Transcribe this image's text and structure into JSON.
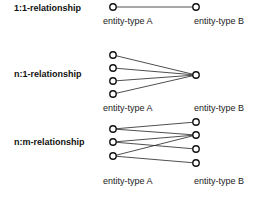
{
  "diagram": {
    "colors": {
      "stroke": "#222222",
      "fill": "#ffffff"
    },
    "sections": [
      {
        "label": "1:1-relationship",
        "entity_a_label": "entity-type A",
        "entity_b_label": "entity-type B",
        "a_nodes": 1,
        "b_nodes": 1,
        "edges": [
          [
            0,
            0
          ]
        ]
      },
      {
        "label": "n:1-relationship",
        "entity_a_label": "entity-type A",
        "entity_b_label": "entity-type B",
        "a_nodes": 4,
        "b_nodes": 1,
        "edges": [
          [
            0,
            0
          ],
          [
            1,
            0
          ],
          [
            2,
            0
          ],
          [
            3,
            0
          ]
        ]
      },
      {
        "label": "n:m-relationship",
        "entity_a_label": "entity-type A",
        "entity_b_label": "entity-type B",
        "a_nodes": 3,
        "b_nodes": 4,
        "edges": [
          [
            0,
            0
          ],
          [
            0,
            1
          ],
          [
            1,
            1
          ],
          [
            1,
            2
          ],
          [
            2,
            1
          ],
          [
            2,
            3
          ]
        ]
      }
    ]
  }
}
